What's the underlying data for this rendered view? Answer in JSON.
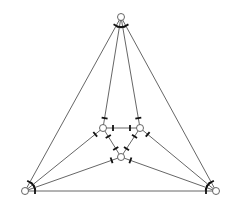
{
  "diagram": {
    "type": "graph",
    "colors": {
      "edge": "#555555",
      "tick": "#111111",
      "node_fill": "#ffffff",
      "background": "#ffffff"
    },
    "node_radius": 3.5,
    "nodes": [
      {
        "id": "top",
        "x": 121,
        "y": 17
      },
      {
        "id": "inner-left",
        "x": 103,
        "y": 128
      },
      {
        "id": "inner-right",
        "x": 140,
        "y": 128
      },
      {
        "id": "inner-bottom",
        "x": 121,
        "y": 157
      },
      {
        "id": "outer-left",
        "x": 25,
        "y": 191
      },
      {
        "id": "outer-right",
        "x": 216,
        "y": 191
      }
    ],
    "edges": [
      [
        "top",
        "inner-left"
      ],
      [
        "top",
        "inner-right"
      ],
      [
        "top",
        "outer-left"
      ],
      [
        "top",
        "outer-right"
      ],
      [
        "inner-left",
        "inner-right"
      ],
      [
        "inner-left",
        "inner-bottom"
      ],
      [
        "inner-right",
        "inner-bottom"
      ],
      [
        "inner-left",
        "outer-left"
      ],
      [
        "inner-right",
        "outer-right"
      ],
      [
        "inner-bottom",
        "outer-left"
      ],
      [
        "inner-bottom",
        "outer-right"
      ],
      [
        "outer-left",
        "outer-right"
      ]
    ]
  }
}
